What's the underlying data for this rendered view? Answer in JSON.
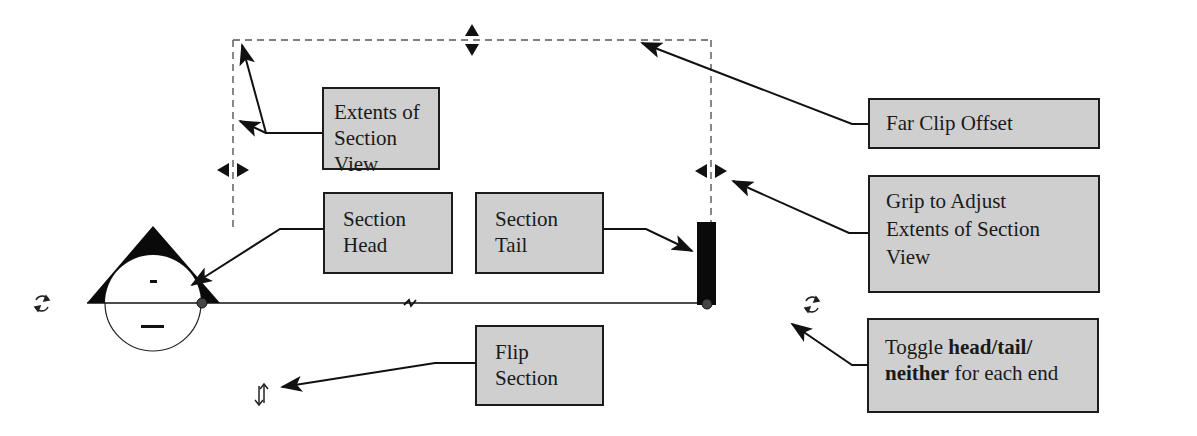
{
  "diagram": {
    "callouts": {
      "extents": {
        "line1": "Extents of",
        "line2": "Section View"
      },
      "far_clip": {
        "line1": "Far Clip Offset"
      },
      "grip": {
        "line1": "Grip to Adjust",
        "line2": "Extents of Section",
        "line3": "View"
      },
      "head": {
        "line1": "Section",
        "line2": "Head"
      },
      "tail": {
        "line1": "Section",
        "line2": "Tail"
      },
      "flip": {
        "line1": "Flip",
        "line2": "Section"
      },
      "toggle": {
        "pre": "Toggle ",
        "bold1": "head/tail/",
        "bold2": "neither",
        "post": " for each end"
      }
    },
    "symbols": {
      "head_top_mark": "-",
      "head_bottom_mark": "---",
      "rotate_left_icon": "cycle-arrows",
      "rotate_right_icon": "cycle-arrows",
      "flip_icon": "flip-arrows",
      "grip_icons": [
        "top-grip",
        "left-grip",
        "right-grip"
      ]
    },
    "colors": {
      "callout_fill": "#cfcfcf",
      "callout_border": "#1c1c1c",
      "line": "#111111",
      "dashed": "#555555",
      "dot": "#444444"
    }
  }
}
